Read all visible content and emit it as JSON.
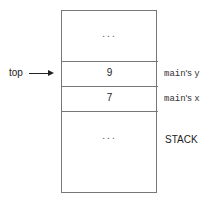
{
  "diagram": {
    "pointer": {
      "label": "top"
    },
    "cells": [
      {
        "value": "...",
        "kind": "ellipsis"
      },
      {
        "value": "9",
        "annotation_var": "main",
        "annotation_poss": "'s ",
        "annotation_name": "y"
      },
      {
        "value": "7",
        "annotation_var": "main",
        "annotation_poss": "'s ",
        "annotation_name": "x"
      },
      {
        "value": "...",
        "kind": "ellipsis"
      }
    ],
    "stack_label": "STACK"
  }
}
